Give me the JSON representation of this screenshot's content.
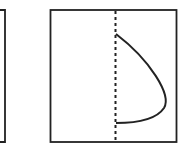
{
  "diagram": {
    "panels": [
      {
        "id": "left-panel",
        "partial": true
      },
      {
        "id": "right-panel",
        "axis": "dashed-vertical",
        "curve": "parabolic-profile"
      }
    ],
    "colors": {
      "stroke": "#222222",
      "background": "#ffffff"
    }
  }
}
